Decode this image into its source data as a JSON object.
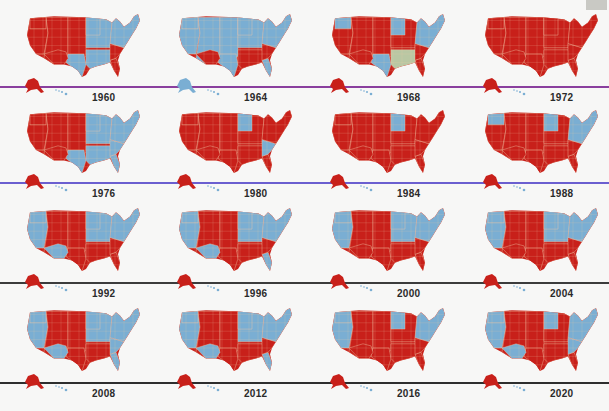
{
  "colors": {
    "red": "#c8201a",
    "blue": "#7aaed3",
    "third_party": "#b9c7a3",
    "background": "#f7f7f6",
    "state_border": "#f2c9a8",
    "corner_box": "#c9c9c4"
  },
  "row_lines": [
    {
      "y": 86,
      "color": "#8a3f9e"
    },
    {
      "y": 182,
      "color": "#6b5fd0"
    },
    {
      "y": 282,
      "color": "#3c3c3c"
    },
    {
      "y": 382,
      "color": "#2e2e2e"
    }
  ],
  "maps": [
    {
      "year": "1960",
      "dominant": "mixed",
      "red_share": 0.55,
      "notes": "West/Plains red; Northeast & South blue; Florida red"
    },
    {
      "year": "1964",
      "dominant": "blue",
      "red_share": 0.12,
      "notes": "Arizona and Deep South red"
    },
    {
      "year": "1968",
      "dominant": "red",
      "red_share": 0.75,
      "notes": "Deep South third-party (grey-green); Texas, Washington, Minnesota, Michigan, Northeast blue"
    },
    {
      "year": "1972",
      "dominant": "red",
      "red_share": 0.98,
      "notes": "Nearly all red; Massachusetts blue"
    },
    {
      "year": "1976",
      "dominant": "mixed",
      "red_share": 0.5,
      "notes": "West red; South & parts of Northeast blue"
    },
    {
      "year": "1980",
      "dominant": "red",
      "red_share": 0.9,
      "notes": "Minnesota, Georgia, West Virginia, Maryland blue"
    },
    {
      "year": "1984",
      "dominant": "red",
      "red_share": 0.97,
      "notes": "Minnesota blue"
    },
    {
      "year": "1988",
      "dominant": "red",
      "red_share": 0.8,
      "notes": "Washington, Oregon, Minnesota, Wisconsin, Iowa, New York, West Virginia blue"
    },
    {
      "year": "1992",
      "dominant": "mixed",
      "red_share": 0.4,
      "notes": "Interior West, Plains, Texas, parts of South red; coasts blue"
    },
    {
      "year": "1996",
      "dominant": "mixed",
      "red_share": 0.4,
      "notes": "Plains/Mountain West, Texas, Deep South red; rest blue"
    },
    {
      "year": "2000",
      "dominant": "red",
      "red_share": 0.6,
      "notes": "West Coast, New Mexico, Upper Midwest, Northeast blue"
    },
    {
      "year": "2004",
      "dominant": "red",
      "red_share": 0.62,
      "notes": "West Coast, Upper Midwest, Northeast blue"
    },
    {
      "year": "2008",
      "dominant": "mixed",
      "red_share": 0.45,
      "notes": "West Coast, Colorado, New Mexico, Nevada, Midwest, Virginia, Florida blue"
    },
    {
      "year": "2012",
      "dominant": "mixed",
      "red_share": 0.47,
      "notes": "Similar to 2008; Indiana & North Carolina red"
    },
    {
      "year": "2016",
      "dominant": "red",
      "red_share": 0.57,
      "notes": "West Coast, Colorado, New Mexico, Nevada, Minnesota, Illinois, Virginia, Northeast blue"
    },
    {
      "year": "2020",
      "dominant": "mixed",
      "red_share": 0.5,
      "notes": "Arizona, Georgia, Michigan, Wisconsin, Pennsylvania blue"
    }
  ]
}
